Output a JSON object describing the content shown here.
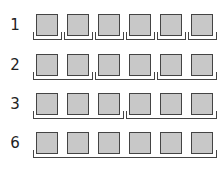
{
  "rows": [
    {
      "label": "1",
      "items": 6,
      "group_size": 1,
      "groups": 6
    },
    {
      "label": "2",
      "items": 6,
      "group_size": 2,
      "groups": 3
    },
    {
      "label": "3",
      "items": 6,
      "group_size": 3,
      "groups": 2
    },
    {
      "label": "6",
      "items": 6,
      "group_size": 6,
      "groups": 1
    }
  ],
  "colors": {
    "square_fill": "#c8c8c8",
    "stroke": "#444444"
  }
}
